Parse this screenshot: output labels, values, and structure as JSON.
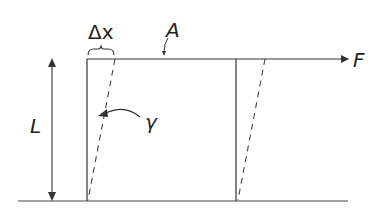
{
  "diagram": {
    "labels": {
      "delta_x": "Δx",
      "area": "A",
      "force": "F",
      "length": "L",
      "shear_angle": "γ"
    },
    "colors": {
      "line": "#333333",
      "background": "#ffffff"
    }
  }
}
